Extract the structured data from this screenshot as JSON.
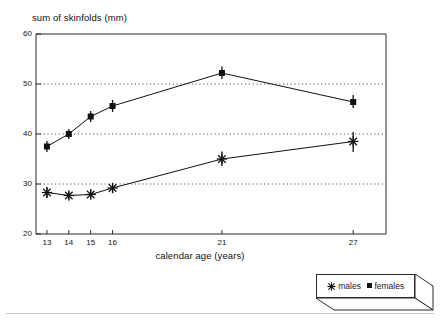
{
  "chart_data": {
    "type": "line",
    "title": "",
    "subtitle": "",
    "xlabel": "calendar age (years)",
    "ylabel": "sum of skinfolds (mm)",
    "x": [
      13,
      14,
      15,
      16,
      21,
      27
    ],
    "xtick_labels": [
      "13",
      "14",
      "15",
      "16",
      "21",
      "27"
    ],
    "ytick_labels": [
      "20",
      "30",
      "40",
      "50",
      "60"
    ],
    "yticks": [
      20,
      30,
      40,
      50,
      60
    ],
    "xlim": [
      12.5,
      28.5
    ],
    "ylim": [
      20,
      60
    ],
    "grid": "horizontal-dotted",
    "gridlines": [
      30,
      40,
      50
    ],
    "legend_position": "bottom-right-outside",
    "series": [
      {
        "name": "males",
        "marker": "asterisk",
        "color": "#111111",
        "values": [
          28.3,
          27.7,
          27.9,
          29.2,
          35.0,
          38.5
        ],
        "error_low": [
          27.2,
          26.9,
          27.0,
          28.2,
          33.6,
          36.4
        ],
        "error_high": [
          29.4,
          28.5,
          28.9,
          30.2,
          36.5,
          40.4
        ]
      },
      {
        "name": "females",
        "marker": "square",
        "color": "#111111",
        "values": [
          37.5,
          40.0,
          43.5,
          45.6,
          52.2,
          46.4
        ],
        "error_low": [
          36.4,
          39.0,
          42.4,
          44.4,
          51.0,
          45.2
        ],
        "error_high": [
          38.6,
          41.0,
          44.6,
          46.8,
          53.5,
          47.8
        ]
      }
    ]
  },
  "legend": {
    "entries": [
      {
        "label": "males",
        "marker": "asterisk"
      },
      {
        "label": "females",
        "marker": "square"
      }
    ]
  },
  "colors": {
    "axis": "#2b2b2b",
    "grid": "#555555",
    "series": "#111111",
    "background": "#ffffff",
    "rule": "#c9c9c9"
  }
}
